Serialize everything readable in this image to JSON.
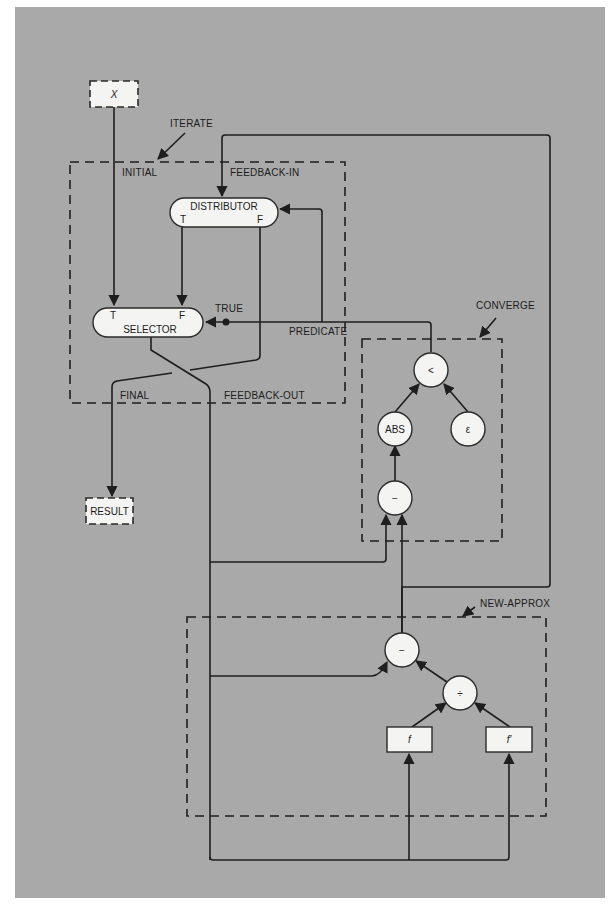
{
  "diagram": {
    "type": "dataflow-graph",
    "colors": {
      "background": "#a9a9a9",
      "page": "#ffffff",
      "node_fill": "#f4f4f2",
      "ink": "#1e1e1e"
    },
    "terminals": {
      "input": {
        "label": "X"
      },
      "output": {
        "label": "RESULT"
      }
    },
    "groups": {
      "iterate": {
        "label": "ITERATE"
      },
      "converge": {
        "label": "CONVERGE"
      },
      "new_approx": {
        "label": "NEW-APPROX"
      }
    },
    "port_labels": {
      "initial": "INITIAL",
      "feedback_in": "FEEDBACK-IN",
      "final": "FINAL",
      "feedback_out": "FEEDBACK-OUT",
      "predicate": "PREDICATE",
      "true": "TRUE"
    },
    "nodes": {
      "distributor": {
        "label": "DISTRIBUTOR",
        "port_t": "T",
        "port_f": "F"
      },
      "selector": {
        "label": "SELECTOR",
        "port_t": "T",
        "port_f": "F"
      },
      "less_than": {
        "label": "<"
      },
      "abs": {
        "label": "ABS"
      },
      "epsilon": {
        "label": "ε"
      },
      "subtract_converge": {
        "label": "−"
      },
      "subtract_new": {
        "label": "−"
      },
      "divide": {
        "label": "÷"
      },
      "f": {
        "label": "f"
      },
      "f_prime": {
        "label": "f′"
      }
    }
  }
}
